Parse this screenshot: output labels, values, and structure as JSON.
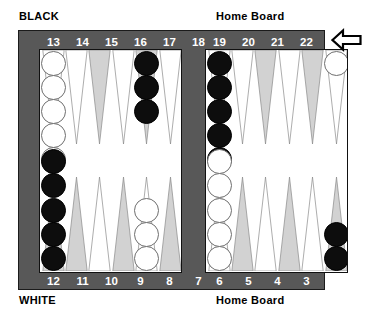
{
  "labels": {
    "black_player": "BLACK",
    "white_player": "WHITE",
    "home_board_top": "Home Board",
    "home_board_bottom": "Home Board"
  },
  "board": {
    "frame_color": "#585858",
    "surface_color": "#ffffff",
    "point_gray_color": "#d2d2d2",
    "point_outline_color": "#8a8a8a",
    "black_checker_color": "#0d0d0d",
    "white_checker_color": "#ffffff",
    "number_rows": {
      "top_left": [
        "13",
        "14",
        "15",
        "16",
        "17",
        "18"
      ],
      "top_right": [
        "19",
        "20",
        "21",
        "22",
        "23",
        "24"
      ],
      "bottom_left": [
        "12",
        "11",
        "10",
        "9",
        "8",
        "7"
      ],
      "bottom_right": [
        "6",
        "5",
        "4",
        "3",
        "2",
        "1"
      ]
    }
  },
  "direction_arrow": {
    "icon": "arrow-left-icon",
    "direction": "left"
  },
  "chart_data": {
    "type": "table",
    "points": [
      {
        "point": "13",
        "quadrant": "top-left",
        "slot": 0,
        "triangle": "white",
        "color": "white",
        "count": 6,
        "shown": 5,
        "label": "6"
      },
      {
        "point": "14",
        "quadrant": "top-left",
        "slot": 1,
        "triangle": "white",
        "color": null,
        "count": 0,
        "shown": 0,
        "label": ""
      },
      {
        "point": "15",
        "quadrant": "top-left",
        "slot": 2,
        "triangle": "gray",
        "color": null,
        "count": 0,
        "shown": 0,
        "label": ""
      },
      {
        "point": "16",
        "quadrant": "top-left",
        "slot": 3,
        "triangle": "white",
        "color": null,
        "count": 0,
        "shown": 0,
        "label": ""
      },
      {
        "point": "17",
        "quadrant": "top-left",
        "slot": 4,
        "triangle": "gray",
        "color": "black",
        "count": 3,
        "shown": 3,
        "label": ""
      },
      {
        "point": "18",
        "quadrant": "top-left",
        "slot": 5,
        "triangle": "white",
        "color": null,
        "count": 0,
        "shown": 0,
        "label": ""
      },
      {
        "point": "19",
        "quadrant": "top-right",
        "slot": 0,
        "triangle": "white",
        "color": "black",
        "count": 5,
        "shown": 5,
        "label": ""
      },
      {
        "point": "20",
        "quadrant": "top-right",
        "slot": 1,
        "triangle": "white",
        "color": null,
        "count": 0,
        "shown": 0,
        "label": ""
      },
      {
        "point": "21",
        "quadrant": "top-right",
        "slot": 2,
        "triangle": "gray",
        "color": null,
        "count": 0,
        "shown": 0,
        "label": ""
      },
      {
        "point": "22",
        "quadrant": "top-right",
        "slot": 3,
        "triangle": "white",
        "color": null,
        "count": 0,
        "shown": 0,
        "label": ""
      },
      {
        "point": "23",
        "quadrant": "top-right",
        "slot": 4,
        "triangle": "gray",
        "color": null,
        "count": 0,
        "shown": 0,
        "label": ""
      },
      {
        "point": "24",
        "quadrant": "top-right",
        "slot": 5,
        "triangle": "white",
        "color": "white",
        "count": 1,
        "shown": 1,
        "label": ""
      },
      {
        "point": "12",
        "quadrant": "bottom-left",
        "slot": 0,
        "triangle": "gray",
        "color": "black",
        "count": 5,
        "shown": 5,
        "label": ""
      },
      {
        "point": "11",
        "quadrant": "bottom-left",
        "slot": 1,
        "triangle": "gray",
        "color": null,
        "count": 0,
        "shown": 0,
        "label": ""
      },
      {
        "point": "10",
        "quadrant": "bottom-left",
        "slot": 2,
        "triangle": "white",
        "color": null,
        "count": 0,
        "shown": 0,
        "label": ""
      },
      {
        "point": "9",
        "quadrant": "bottom-left",
        "slot": 3,
        "triangle": "gray",
        "color": null,
        "count": 0,
        "shown": 0,
        "label": ""
      },
      {
        "point": "8",
        "quadrant": "bottom-left",
        "slot": 4,
        "triangle": "white",
        "color": "white",
        "count": 3,
        "shown": 3,
        "label": ""
      },
      {
        "point": "7",
        "quadrant": "bottom-left",
        "slot": 5,
        "triangle": "gray",
        "color": null,
        "count": 0,
        "shown": 0,
        "label": ""
      },
      {
        "point": "6",
        "quadrant": "bottom-right",
        "slot": 0,
        "triangle": "white",
        "color": "white",
        "count": 5,
        "shown": 5,
        "label": ""
      },
      {
        "point": "5",
        "quadrant": "bottom-right",
        "slot": 1,
        "triangle": "gray",
        "color": null,
        "count": 0,
        "shown": 0,
        "label": ""
      },
      {
        "point": "4",
        "quadrant": "bottom-right",
        "slot": 2,
        "triangle": "white",
        "color": null,
        "count": 0,
        "shown": 0,
        "label": ""
      },
      {
        "point": "3",
        "quadrant": "bottom-right",
        "slot": 3,
        "triangle": "gray",
        "color": null,
        "count": 0,
        "shown": 0,
        "label": ""
      },
      {
        "point": "2",
        "quadrant": "bottom-right",
        "slot": 4,
        "triangle": "white",
        "color": null,
        "count": 0,
        "shown": 0,
        "label": ""
      },
      {
        "point": "1",
        "quadrant": "bottom-right",
        "slot": 5,
        "triangle": "gray",
        "color": "black",
        "count": 2,
        "shown": 2,
        "label": ""
      }
    ]
  }
}
